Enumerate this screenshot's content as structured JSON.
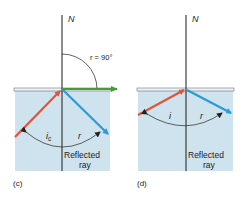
{
  "panels": [
    {
      "id": "c",
      "caption": "(c)",
      "normal_label": "N",
      "refracted_angle_label": "r = 90°",
      "incident_angle_label": "i",
      "incident_angle_sub": "c",
      "reflected_angle_label": "r",
      "reflected_text_line1": "Reflected",
      "reflected_text_line2": "ray"
    },
    {
      "id": "d",
      "caption": "(d)",
      "normal_label": "N",
      "incident_angle_label": "i",
      "reflected_angle_label": "r",
      "reflected_text_line1": "Reflected",
      "reflected_text_line2": "ray"
    }
  ],
  "colors": {
    "medium": "#cfe3ee",
    "incident_ray": "#e0543a",
    "reflected_ray": "#2b9ad6",
    "refracted_ray": "#4a9a3c",
    "normal": "#1a1a1a"
  }
}
